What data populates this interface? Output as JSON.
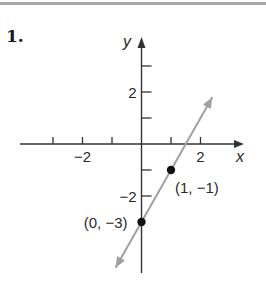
{
  "problem": {
    "number": "1."
  },
  "chart_data": {
    "type": "line",
    "title": "",
    "xlabel": "x",
    "ylabel": "y",
    "xlim": [
      -3.5,
      3.5
    ],
    "ylim": [
      -4.9,
      4.0
    ],
    "x_ticks": [
      -3,
      -2,
      -1,
      1,
      2
    ],
    "x_tick_labels": [
      {
        "value": -2,
        "label": "−2"
      },
      {
        "value": 2,
        "label": "2"
      }
    ],
    "y_ticks": [
      3,
      2,
      1,
      -1,
      -2
    ],
    "y_tick_labels": [
      {
        "value": 2,
        "label": "2"
      },
      {
        "value": -2,
        "label": "−2"
      }
    ],
    "grid": false,
    "series": [
      {
        "name": "line",
        "equation": "y = 2x - 3",
        "color": "#a0a0a0",
        "x": [
          -0.88,
          2.4
        ],
        "y": [
          -4.76,
          1.8
        ],
        "arrows_both_ends": true
      }
    ],
    "points": [
      {
        "x": 0,
        "y": -3,
        "label": "(0, −3)"
      },
      {
        "x": 1,
        "y": -1,
        "label": "(1, −1)"
      }
    ]
  }
}
